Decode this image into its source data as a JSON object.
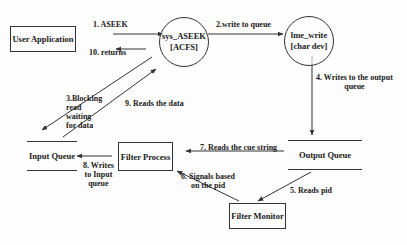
{
  "diagram": {
    "type": "data-flow",
    "nodes": {
      "user_app": {
        "label": "User Application",
        "shape": "rectangle"
      },
      "sys_aseek": {
        "line1": "sys_ASEEK",
        "line2": "[ACFS]",
        "shape": "circle"
      },
      "lme_write": {
        "line1": "lme_write",
        "line2": "[char dev]",
        "shape": "circle"
      },
      "output_queue": {
        "label": "Output Queue",
        "shape": "queue"
      },
      "filter_monitor": {
        "label": "Filter Monitor",
        "shape": "rectangle"
      },
      "filter_process": {
        "label": "Filter Process",
        "shape": "rectangle"
      },
      "input_queue": {
        "label": "Input Queue",
        "shape": "queue"
      }
    },
    "edges": {
      "e1": {
        "label": "1. ASEEK",
        "from": "User Application",
        "to": "sys_ASEEK"
      },
      "e2": {
        "label": "2.write to queue",
        "from": "sys_ASEEK",
        "to": "lme_write"
      },
      "e3": {
        "line1": "3.Blocking",
        "line2": "read",
        "line3": "waiting",
        "line4": "for data",
        "from": "sys_ASEEK",
        "to": "Input Queue"
      },
      "e4": {
        "line1": "4. Writes to the output",
        "line2": "queue",
        "from": "lme_write",
        "to": "Output Queue"
      },
      "e5": {
        "label": "5. Reads pid",
        "from": "Output Queue",
        "to": "Filter Monitor"
      },
      "e6": {
        "line1": "6. Signals based",
        "line2": "on the pid",
        "from": "Filter Monitor",
        "to": "Filter Process"
      },
      "e7": {
        "label": "7. Reads the cue string",
        "from": "Output Queue",
        "to": "Filter Process"
      },
      "e8": {
        "line1": "8. Writes",
        "line2": "to Input",
        "line3": "queue",
        "from": "Filter Process",
        "to": "Input Queue"
      },
      "e9": {
        "label": "9.  Reads the data",
        "from": "Input Queue",
        "to": "sys_ASEEK"
      },
      "e10": {
        "label": "10. returns",
        "from": "sys_ASEEK",
        "to": "User Application"
      }
    }
  },
  "colors": {
    "stroke": "#333333",
    "text": "#1a1a1a",
    "background": "#fdfdfd",
    "bleed_text": "#e4e4e4"
  }
}
